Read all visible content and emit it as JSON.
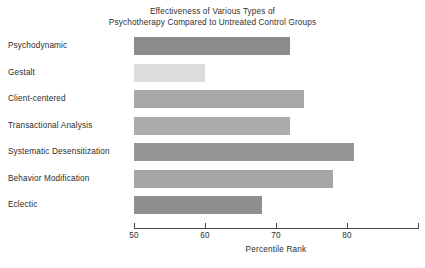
{
  "chart_data": {
    "type": "bar",
    "orientation": "horizontal",
    "title": "Effectiveness of Various Types of Psychotherapy Compared to Untreated Control Groups",
    "title_lines": [
      "Effectiveness of Various Types of",
      "Psychotherapy Compared to Untreated Control Groups"
    ],
    "xlabel": "Percentile Rank",
    "ylabel": "",
    "xlim": [
      50,
      90
    ],
    "baseline": 50,
    "grid": false,
    "legend": null,
    "xticks": [
      {
        "value": 50,
        "label": "50"
      },
      {
        "value": 60,
        "label": "60"
      },
      {
        "value": 70,
        "label": "70"
      },
      {
        "value": 80,
        "label": "80"
      },
      {
        "value": 90,
        "label": ""
      }
    ],
    "categories": [
      "Psychodynamic",
      "Gestalt",
      "Client-centered",
      "Transactional Analysis",
      "Systematic Desensitization",
      "Behavior Modification",
      "Eclectic"
    ],
    "values": [
      72,
      60,
      74,
      72,
      81,
      78,
      68
    ],
    "bar_colors": [
      "#8c8c8c",
      "#dcdcdc",
      "#a8a8a8",
      "#ababab",
      "#969696",
      "#a5a5a5",
      "#8f8f8f"
    ],
    "bars": [
      {
        "label": "Psychodynamic",
        "value": 72,
        "color": "#8c8c8c"
      },
      {
        "label": "Gestalt",
        "value": 60,
        "color": "#dcdcdc"
      },
      {
        "label": "Client-centered",
        "value": 74,
        "color": "#a8a8a8"
      },
      {
        "label": "Transactional Analysis",
        "value": 72,
        "color": "#ababab"
      },
      {
        "label": "Systematic Desensitization",
        "value": 81,
        "color": "#969696"
      },
      {
        "label": "Behavior Modification",
        "value": 78,
        "color": "#a5a5a5"
      },
      {
        "label": "Eclectic",
        "value": 68,
        "color": "#8f8f8f"
      }
    ]
  }
}
